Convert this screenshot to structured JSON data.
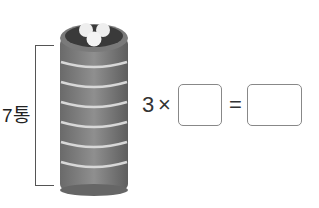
{
  "figure": {
    "bracket_label": "7통",
    "stack_count": 7,
    "dumplings": 3
  },
  "equation": {
    "multiplicand": "3",
    "times": "×",
    "blank1": "",
    "equals": "=",
    "blank2": ""
  }
}
